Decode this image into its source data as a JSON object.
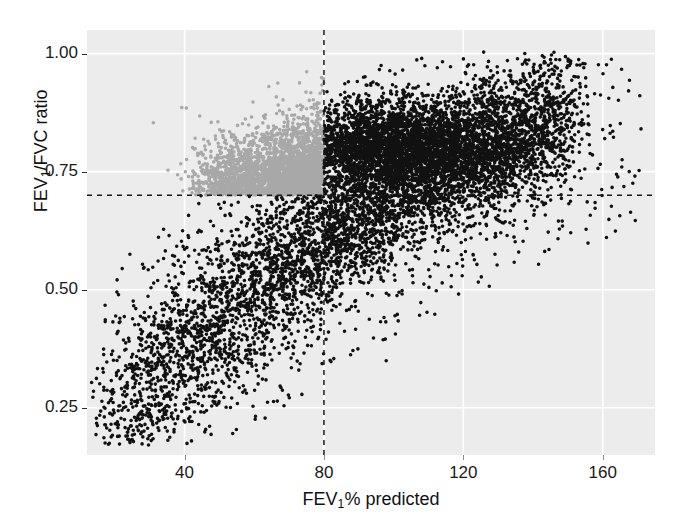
{
  "figure": {
    "background_color": "#ffffff",
    "panel_color": "#ececec",
    "gridline_color": "#ffffff",
    "reference_line_color": "#1a1a1a"
  },
  "chart_data": {
    "type": "scatter",
    "title": "",
    "subtitle": "",
    "xlabel_text": "FEV",
    "xlabel_sub": "1",
    "xlabel_tail": "% predicted",
    "ylabel_text": "FEV",
    "ylabel_sub": "1",
    "ylabel_tail": "/FVC ratio",
    "xlabel": "FEV1% predicted",
    "ylabel": "FEV1/FVC ratio",
    "xlim": [
      12,
      175
    ],
    "ylim": [
      0.15,
      1.05
    ],
    "grid": true,
    "grid_color": "#ffffff",
    "legend_position": "none",
    "xticks": [
      40,
      80,
      120,
      160
    ],
    "xtick_labels": [
      "40",
      "80",
      "120",
      "160"
    ],
    "yticks": [
      0.25,
      0.5,
      0.75,
      1.0
    ],
    "ytick_labels": [
      "0.25",
      "0.50",
      "0.75",
      "1.00"
    ],
    "reference_lines": [
      {
        "orientation": "vertical",
        "value": 80,
        "style": "dashed",
        "color": "#1a1a1a",
        "label": "FEV1% predicted = 80"
      },
      {
        "orientation": "horizontal",
        "value": 0.7,
        "style": "dashed",
        "color": "#1a1a1a",
        "label": "FEV1/FVC ratio = 0.70"
      }
    ],
    "series": [
      {
        "name": "Black points (FEV1/FVC < 0.70 or FEV1% >= 80)",
        "color": "#111111",
        "marker": "circle",
        "marker_size_px": 3.6,
        "approx_n": 6400,
        "description": "Large dense band running from lower-left (FEV1% ~18, ratio ~0.22) diagonally up to upper-right (FEV1% ~135, ratio ~0.90); plus all points right of the 80 line above 0.70."
      },
      {
        "name": "Grey points (FEV1/FVC >= 0.70 and FEV1% < 80)",
        "color": "#a8a8a8",
        "marker": "circle",
        "marker_size_px": 3.6,
        "approx_n": 1500,
        "description": "Dense wedge in upper-left quadrant bounded right by FEV1% = 80 and below by ratio = 0.70, fading upward toward ratio 0.95."
      }
    ],
    "quadrant_summary": [
      {
        "quadrant": "upper-left",
        "x_range": "<80",
        "y_range": ">=0.70",
        "point_color": "#a8a8a8",
        "density": "dense wedge"
      },
      {
        "quadrant": "upper-right",
        "x_range": ">=80",
        "y_range": ">=0.70",
        "point_color": "#111111",
        "density": "very dense"
      },
      {
        "quadrant": "lower-left",
        "x_range": "<80",
        "y_range": "<0.70",
        "point_color": "#111111",
        "density": "dense diagonal band"
      },
      {
        "quadrant": "lower-right",
        "x_range": ">=80",
        "y_range": "<0.70",
        "point_color": "#111111",
        "density": "sparse"
      }
    ]
  },
  "caption": {
    "text": "·"
  }
}
